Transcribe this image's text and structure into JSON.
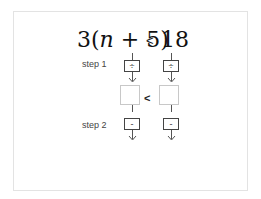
{
  "inequality": {
    "lhs_prefix": "3(",
    "lhs_var": "n",
    "lhs_suffix": " + 5)",
    "relation": "<",
    "rhs": "18"
  },
  "steps": [
    {
      "label": "step 1",
      "operation": "÷",
      "left_box": "",
      "right_box": ""
    },
    {
      "label": "step 2",
      "operation": "-",
      "left_box": "",
      "right_box": ""
    }
  ],
  "intermediate": {
    "relation": "<",
    "left_value": "",
    "right_value": ""
  },
  "colors": {
    "frame_border": "#e3e3e3",
    "box_border": "#444444",
    "answer_box_border": "#c8c8c8"
  }
}
